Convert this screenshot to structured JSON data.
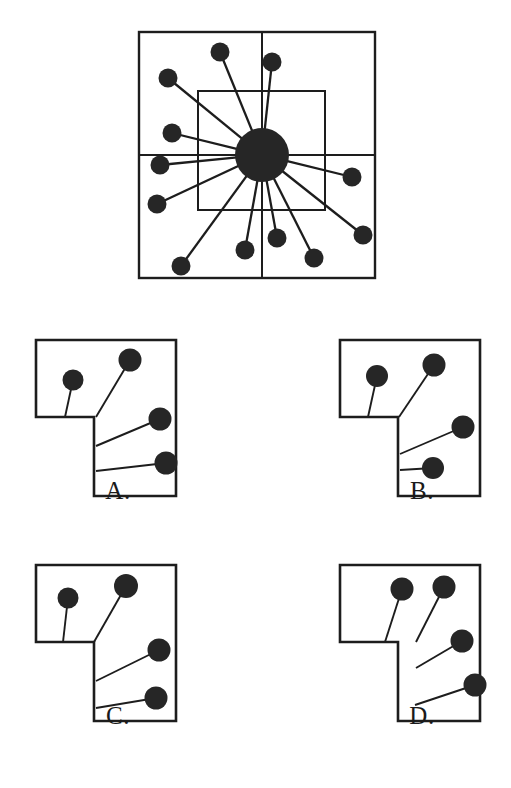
{
  "page": {
    "kind": "multiple-choice-spatial-reasoning-figure",
    "background_color": "#ffffff",
    "ink_color": "#1d1d1d",
    "node_fill_color": "#262626",
    "width": 511,
    "height": 788
  },
  "stimulus": {
    "name": "radial-node-diagram",
    "outer_frame": {
      "x": 139,
      "y": 32,
      "width": 236,
      "height": 246
    },
    "vertical_divider_x": 262,
    "horizontal_divider_y": 155,
    "inner_frame": {
      "x": 198,
      "y": 91,
      "width": 127,
      "height": 119
    },
    "hub": {
      "cx": 262,
      "cy": 155,
      "r": 27
    },
    "node_radius": 9.5,
    "nodes": [
      {
        "id": "n1",
        "cx": 220,
        "cy": 52
      },
      {
        "id": "n2",
        "cx": 168,
        "cy": 78
      },
      {
        "id": "n3",
        "cx": 172,
        "cy": 133
      },
      {
        "id": "n4",
        "cx": 160,
        "cy": 165
      },
      {
        "id": "n5",
        "cx": 157,
        "cy": 204
      },
      {
        "id": "n6",
        "cx": 181,
        "cy": 266
      },
      {
        "id": "n7",
        "cx": 245,
        "cy": 250
      },
      {
        "id": "n8",
        "cx": 277,
        "cy": 238
      },
      {
        "id": "n9",
        "cx": 314,
        "cy": 258
      },
      {
        "id": "n10",
        "cx": 363,
        "cy": 235
      },
      {
        "id": "n11",
        "cx": 352,
        "cy": 177
      },
      {
        "id": "n12",
        "cx": 272,
        "cy": 62
      }
    ]
  },
  "options": [
    {
      "id": "A",
      "label": "A.",
      "name": "option-a",
      "outline": "M 18 22 L 158 22 L 158 178 L 76 178 L 76 99 L 18 99 Z",
      "nodes": [
        {
          "cx": 55,
          "cy": 62,
          "r": 10.5,
          "anchor_x": 47,
          "anchor_y": 99
        },
        {
          "cx": 112,
          "cy": 42,
          "r": 11.5,
          "anchor_x": 78,
          "anchor_y": 99
        },
        {
          "cx": 142,
          "cy": 101,
          "r": 11.5,
          "anchor_x": 78,
          "anchor_y": 128
        },
        {
          "cx": 148,
          "cy": 145,
          "r": 11.5,
          "anchor_x": 78,
          "anchor_y": 153
        }
      ]
    },
    {
      "id": "B",
      "label": "B.",
      "name": "option-b",
      "outline": "M 18 22 L 158 22 L 158 178 L 76 178 L 76 99 L 18 99 Z",
      "nodes": [
        {
          "cx": 55,
          "cy": 58,
          "r": 11.0,
          "anchor_x": 46,
          "anchor_y": 99
        },
        {
          "cx": 112,
          "cy": 47,
          "r": 11.5,
          "anchor_x": 77,
          "anchor_y": 99
        },
        {
          "cx": 141,
          "cy": 109,
          "r": 11.5,
          "anchor_x": 78,
          "anchor_y": 136
        },
        {
          "cx": 111,
          "cy": 150,
          "r": 11.0,
          "anchor_x": 78,
          "anchor_y": 152
        }
      ]
    },
    {
      "id": "C",
      "label": "C.",
      "name": "option-c",
      "outline": "M 18 22 L 158 22 L 158 178 L 76 178 L 76 99 L 18 99 Z",
      "nodes": [
        {
          "cx": 50,
          "cy": 55,
          "r": 10.5,
          "anchor_x": 45,
          "anchor_y": 99
        },
        {
          "cx": 108,
          "cy": 43,
          "r": 12.0,
          "anchor_x": 76,
          "anchor_y": 99
        },
        {
          "cx": 141,
          "cy": 107,
          "r": 11.5,
          "anchor_x": 78,
          "anchor_y": 138
        },
        {
          "cx": 138,
          "cy": 155,
          "r": 11.5,
          "anchor_x": 78,
          "anchor_y": 165
        }
      ]
    },
    {
      "id": "D",
      "label": "D.",
      "name": "option-d",
      "outline": "M 18 22 L 158 22 L 158 178 L 76 178 L 76 99 L 18 99 Z",
      "nodes": [
        {
          "cx": 80,
          "cy": 46,
          "r": 11.5,
          "anchor_x": 63,
          "anchor_y": 99
        },
        {
          "cx": 122,
          "cy": 44,
          "r": 11.5,
          "anchor_x": 94,
          "anchor_y": 99
        },
        {
          "cx": 140,
          "cy": 98,
          "r": 11.5,
          "anchor_x": 94,
          "anchor_y": 125
        },
        {
          "cx": 153,
          "cy": 142,
          "r": 11.5,
          "anchor_x": 93,
          "anchor_y": 162
        }
      ]
    }
  ]
}
